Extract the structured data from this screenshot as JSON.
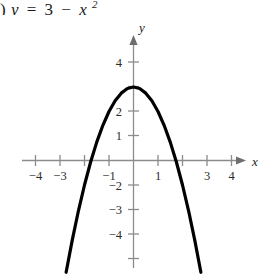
{
  "caption": {
    "prefix": ")",
    "lhs": "y",
    "equals": "=",
    "constant": "3",
    "minus": "−",
    "variable": "x",
    "exponent": "2",
    "full_text": ") y = 3 − x²"
  },
  "axes": {
    "x_label": "x",
    "y_label": "y",
    "x_arrow": "arrow-right",
    "y_arrow": "arrow-up"
  },
  "ticks": {
    "x_visible": [
      "−4",
      "−3",
      "−1",
      "1",
      "3",
      "4"
    ],
    "y_visible": [
      "4",
      "2",
      "1",
      "−2",
      "−3",
      "−4"
    ],
    "x_positions": [
      -4,
      -3,
      -2,
      -1,
      1,
      2,
      3,
      4
    ],
    "y_positions": [
      -4,
      -3,
      -2,
      -1,
      1,
      2,
      3,
      4
    ]
  },
  "colors": {
    "curve": "#000000",
    "axis": "#8c8c8c",
    "text": "#1a1a1a",
    "background": "#ffffff"
  },
  "chart_data": {
    "type": "line",
    "xlabel": "x",
    "ylabel": "y",
    "xlim": [
      -4.7,
      4.7
    ],
    "ylim": [
      -4.7,
      4.7
    ],
    "grid": false,
    "legend": "none",
    "equation": "y = 3 - x^2",
    "vertex": [
      0,
      3
    ],
    "x_intercepts": [
      -1.732,
      1.732
    ],
    "y_intercept": 3,
    "opens": "down",
    "xticks": [
      -4,
      -3,
      -2,
      -1,
      1,
      2,
      3,
      4
    ],
    "yticks": [
      -4,
      -3,
      -2,
      -1,
      1,
      2,
      3,
      4
    ],
    "xtick_labels": [
      "−4",
      "−3",
      "",
      "−1",
      "1",
      "",
      "3",
      "4"
    ],
    "ytick_labels": [
      "−4",
      "−3",
      "−2",
      "",
      "1",
      "2",
      "",
      "4"
    ],
    "series": [
      {
        "name": "y = 3 - x²",
        "x": [
          -2.75,
          -2.5,
          -2.25,
          -2.0,
          -1.75,
          -1.5,
          -1.25,
          -1.0,
          -0.75,
          -0.5,
          -0.25,
          0,
          0.25,
          0.5,
          0.75,
          1.0,
          1.25,
          1.5,
          1.75,
          2.0,
          2.25,
          2.5,
          2.75
        ],
        "y": [
          -4.5625,
          -3.25,
          -2.0625,
          -1.0,
          -0.0625,
          0.75,
          1.4375,
          2.0,
          2.4375,
          2.75,
          2.9375,
          3.0,
          2.9375,
          2.75,
          2.4375,
          2.0,
          1.4375,
          0.75,
          -0.0625,
          -1.0,
          -2.0625,
          -3.25,
          -4.5625
        ]
      }
    ]
  }
}
